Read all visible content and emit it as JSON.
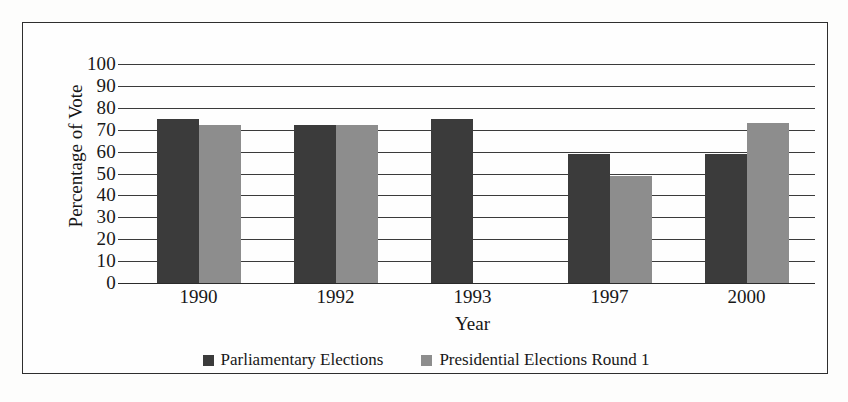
{
  "chart_data": {
    "type": "bar",
    "title": "",
    "subtitle": "",
    "xlabel": "Year",
    "ylabel": "Percentage of Vote",
    "categories": [
      "1990",
      "1992",
      "1993",
      "1997",
      "2000"
    ],
    "series": [
      {
        "name": "Parliamentary Elections",
        "color": "#3b3b3b",
        "values": [
          75,
          72,
          75,
          59,
          59
        ]
      },
      {
        "name": "Presidential Elections Round 1",
        "color": "#8d8d8d",
        "values": [
          72,
          72,
          null,
          49,
          73
        ]
      }
    ],
    "ylim": [
      0,
      100
    ],
    "ytick_labels": [
      "100",
      "90",
      "80",
      "70",
      "60",
      "50",
      "40",
      "30",
      "20",
      "10",
      "0"
    ],
    "ytick_values": [
      100,
      90,
      80,
      70,
      60,
      50,
      40,
      30,
      20,
      10,
      0
    ],
    "grid": true,
    "grid_axis": "y",
    "legend_position": "bottom",
    "frame": true
  },
  "legend": {
    "items": [
      {
        "label": "Parliamentary Elections",
        "swatch": "legend-swatch-dark"
      },
      {
        "label": "Presidential Elections Round 1",
        "swatch": "legend-swatch-gray"
      }
    ]
  }
}
